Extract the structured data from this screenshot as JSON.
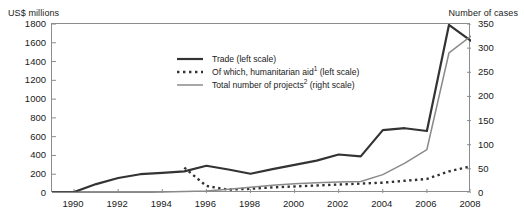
{
  "chart_data": {
    "type": "line",
    "title": "",
    "xlabel": "",
    "ylabel": "US$ millions",
    "y2label": "Number of cases",
    "x": [
      1989,
      1990,
      1991,
      1992,
      1993,
      1994,
      1995,
      1996,
      1997,
      1998,
      1999,
      2000,
      2001,
      2002,
      2003,
      2004,
      2005,
      2006,
      2007,
      2008
    ],
    "xlim": [
      1989,
      2008
    ],
    "ylim": [
      0,
      1800
    ],
    "y2lim": [
      0,
      350
    ],
    "xticks": [
      "1990",
      "1992",
      "1994",
      "1996",
      "1998",
      "2000",
      "2002",
      "2004",
      "2006",
      "2008"
    ],
    "xtick_values": [
      1990,
      1992,
      1994,
      1996,
      1998,
      2000,
      2002,
      2004,
      2006,
      2008
    ],
    "yticks": [
      "0",
      "200",
      "400",
      "600",
      "800",
      "1000",
      "1200",
      "1400",
      "1600",
      "1800"
    ],
    "ytick_values": [
      0,
      200,
      400,
      600,
      800,
      1000,
      1200,
      1400,
      1600,
      1800
    ],
    "y2ticks": [
      "0",
      "50",
      "100",
      "150",
      "200",
      "250",
      "300",
      "350"
    ],
    "y2tick_values": [
      0,
      50,
      100,
      150,
      200,
      250,
      300,
      350
    ],
    "grid": false,
    "legend_position": "upper-center",
    "series": [
      {
        "name": "Trade (left scale)",
        "label_main": "Trade",
        "label_suffix": " (left scale)",
        "axis": "left",
        "style": "solid",
        "color": "#333333",
        "width": 2.2,
        "values": [
          10,
          10,
          95,
          160,
          200,
          215,
          230,
          290,
          250,
          205,
          255,
          300,
          345,
          410,
          390,
          670,
          690,
          660,
          1790,
          1620
        ]
      },
      {
        "name": "Of which, humanitarian aid (left scale)",
        "label_main": "Of which, humanitarian aid",
        "label_sup": "1",
        "label_suffix": " (left scale)",
        "axis": "left",
        "style": "dotted",
        "color": "#333333",
        "width": 2.4,
        "values": [
          null,
          null,
          null,
          null,
          null,
          null,
          270,
          75,
          35,
          45,
          60,
          70,
          80,
          90,
          100,
          110,
          130,
          150,
          230,
          285
        ]
      },
      {
        "name": "Total number of projects (right scale)",
        "label_main": "Total number of projects",
        "label_sup": "2",
        "label_suffix": " (right scale)",
        "axis": "right",
        "style": "solid",
        "color": "#8a8a8a",
        "width": 1.5,
        "values": [
          1,
          1,
          1,
          1,
          1,
          2,
          3,
          4,
          8,
          12,
          16,
          19,
          21,
          23,
          24,
          38,
          62,
          90,
          290,
          325
        ]
      }
    ]
  },
  "legend": {
    "items": [
      {
        "label": "Trade (left scale)",
        "swatch": "solid-dark-line-swatch"
      },
      {
        "label": "Of which, humanitarian aid¹ (left scale)",
        "swatch": "dotted-dark-line-swatch"
      },
      {
        "label": "Total number of projects² (right scale)",
        "swatch": "solid-gray-line-swatch"
      }
    ]
  }
}
